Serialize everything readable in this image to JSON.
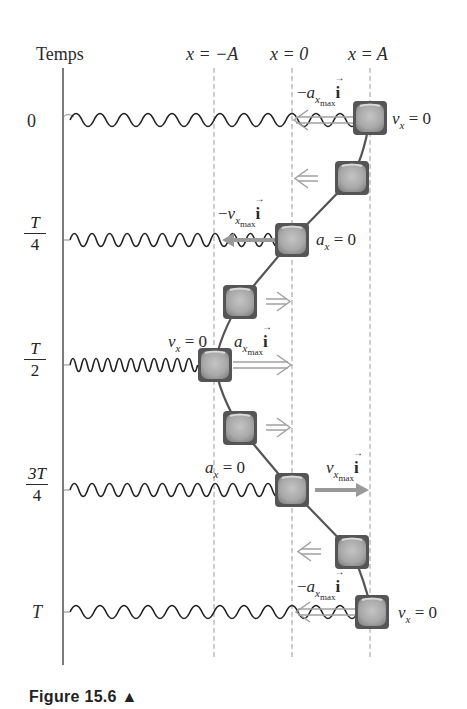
{
  "diagram": {
    "time_axis_label": "Temps",
    "position_labels": [
      {
        "id": "neg_A",
        "text": "x = −A"
      },
      {
        "id": "zero",
        "text": "x = 0"
      },
      {
        "id": "pos_A",
        "text": "x = A"
      }
    ],
    "time_rows": [
      {
        "time": "0",
        "numerator": "",
        "denominator": "",
        "annotation_block": "vx = 0",
        "vector": "−a_xmax i"
      },
      {
        "time": "T/4",
        "numerator": "T",
        "denominator": "4",
        "annotation_block": "ax = 0",
        "vector": "−v_xmax i"
      },
      {
        "time": "T/2",
        "numerator": "T",
        "denominator": "2",
        "annotation_block": "vx = 0",
        "vector": "a_xmax i"
      },
      {
        "time": "3T/4",
        "numerator": "3T",
        "denominator": "4",
        "annotation_block": "ax = 0",
        "vector": "v_xmax i"
      },
      {
        "time": "T",
        "numerator": "",
        "denominator": "",
        "annotation_block": "vx = 0",
        "vector": "−a_xmax i"
      }
    ],
    "labels": {
      "t0": "0",
      "tT": "T",
      "t_quarter_num": "T",
      "t_quarter_den": "4",
      "t_half_num": "T",
      "t_half_den": "2",
      "t_3quarter_num": "3T",
      "t_3quarter_den": "4",
      "x_neg_A": "x = −A",
      "x_zero": "x = 0",
      "x_pos_A": "x = A",
      "v_sym": "v",
      "a_sym": "a",
      "x_sub": "x",
      "max_sub": "max",
      "unit_i": "i",
      "eq_zero": " = 0",
      "minus": "−"
    },
    "colors": {
      "spring": "#1a1a1a",
      "block_fill": "#a9a9a9",
      "block_border": "#555555",
      "arrow_gray": "#9a9a9a",
      "guide_dash": "#9a9a9a",
      "trajectory": "#555555"
    }
  },
  "caption": {
    "text": "Figure 15.6 ▲"
  }
}
